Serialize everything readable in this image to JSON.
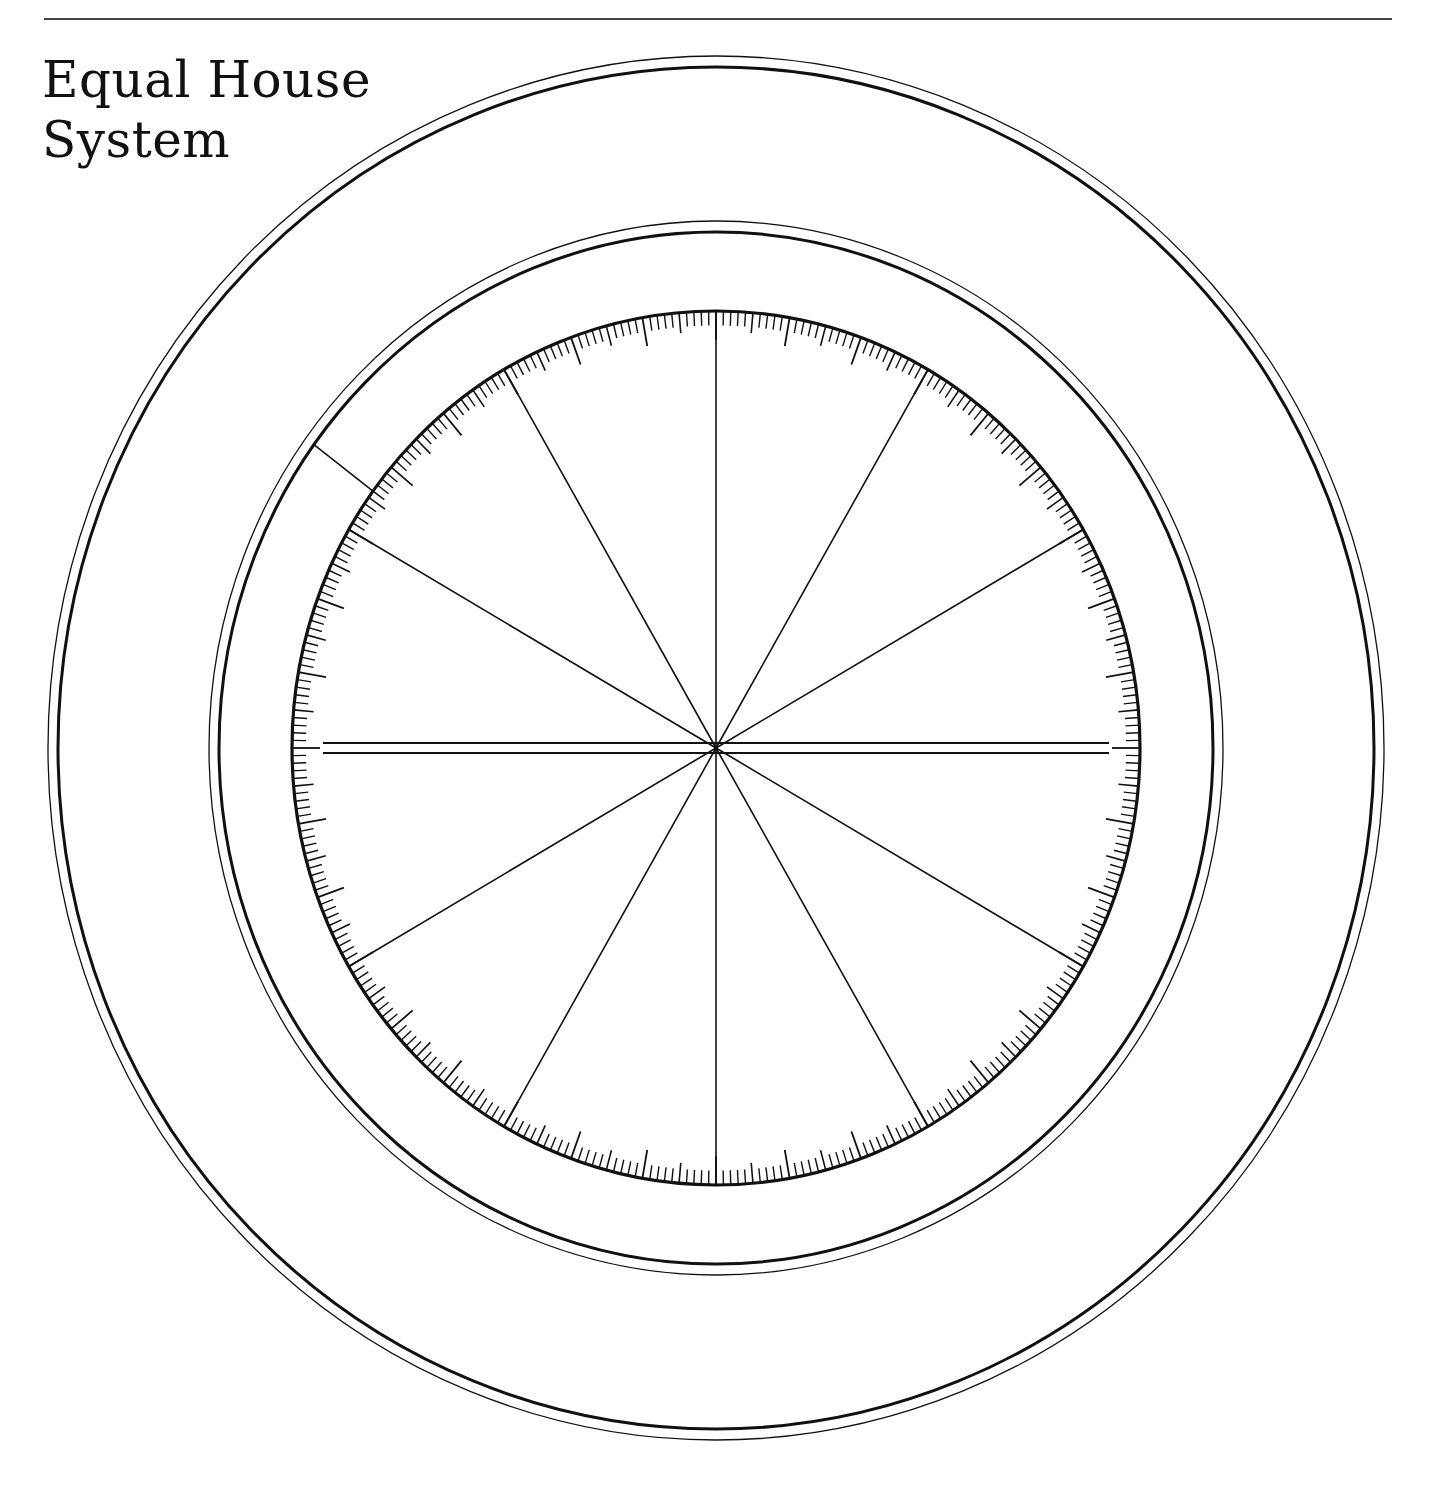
{
  "header": {
    "title_lines": [
      "Equal House",
      "System"
    ]
  },
  "wheel": {
    "center": [
      716,
      748
    ],
    "outer_ring": {
      "inner_thick": [
        658,
        681
      ],
      "outer_thin": [
        668,
        692
      ]
    },
    "middle_ring": {
      "inner_thick": [
        497,
        516
      ],
      "outer_thin": [
        507,
        527
      ]
    },
    "inner_disc": [
      424,
      437
    ],
    "house_count": 12,
    "house_cusp_degrees": [
      0,
      30,
      60,
      90,
      120,
      150,
      180,
      210,
      240,
      270,
      300,
      330
    ],
    "ascendant_axis": {
      "double_line": true,
      "gap": 10,
      "half_length": 393
    },
    "ruler_scale": {
      "divisions": 360,
      "major_every": 10,
      "mid_every": 5
    },
    "marker_line_angle_deg": 144,
    "colors": {
      "line": "#111111",
      "background": "#ffffff"
    }
  }
}
